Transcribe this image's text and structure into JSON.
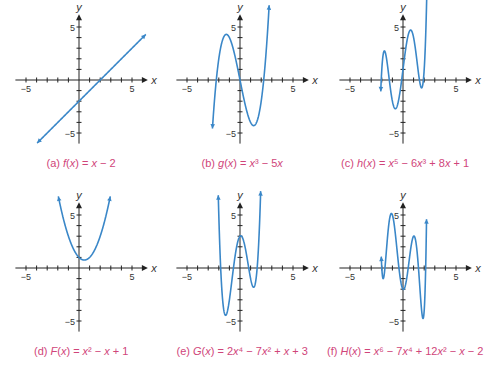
{
  "figure": {
    "background": "#ffffff",
    "curve_color": "#3a87c8",
    "axis_color": "#222222",
    "caption_color": "#d0457a",
    "unit_px": 10.6
  },
  "chart_data": [
    {
      "id": "a",
      "type": "line",
      "title": "(a) f(x) = x − 2",
      "caption_html": "(a) <i>f</i>(<i>x</i>) = <i>x</i> − 2",
      "expression": "x - 2",
      "xlabel": "x",
      "ylabel": "y",
      "x_ticks_labeled": [
        -5,
        5
      ],
      "y_ticks_labeled": [
        5,
        -5
      ],
      "xlim": [
        -6,
        6
      ],
      "ylim": [
        -6,
        6
      ],
      "domain": [
        -3.95,
        6.3
      ],
      "arrows": [
        "start",
        "end"
      ],
      "origin_px": [
        79,
        80
      ],
      "key_points": [
        [
          0,
          -2
        ],
        [
          2,
          0
        ],
        [
          -4,
          -6
        ],
        [
          6,
          4
        ]
      ]
    },
    {
      "id": "b",
      "type": "line",
      "title": "(b) g(x) = x³ − 5x",
      "caption_html": "(b) <i>g</i>(<i>x</i>) = <i>x</i>³ − 5<i>x</i>",
      "expression": "x^3 - 5x",
      "xlabel": "x",
      "ylabel": "y",
      "x_ticks_labeled": [
        -5,
        5
      ],
      "y_ticks_labeled": [
        5,
        -5
      ],
      "xlim": [
        -6,
        6
      ],
      "ylim": [
        -6,
        6
      ],
      "domain": [
        -2.6,
        2.75
      ],
      "arrows": [
        "start",
        "end"
      ],
      "origin_px": [
        240,
        80
      ],
      "key_points": [
        [
          -2.236,
          0
        ],
        [
          0,
          0
        ],
        [
          2.236,
          0
        ],
        [
          -1.29,
          4.3
        ],
        [
          1.29,
          -4.3
        ]
      ]
    },
    {
      "id": "c",
      "type": "line",
      "title": "(c) h(x) = x⁵ − 6x³ + 8x + 1",
      "caption_html": "(c) <i>h</i>(<i>x</i>) = <i>x</i>⁵ − 6<i>x</i>³ + 8<i>x</i> + 1",
      "expression": "x^5 - 6x^3 + 8x + 1",
      "xlabel": "x",
      "ylabel": "y",
      "x_ticks_labeled": [
        -5,
        5
      ],
      "y_ticks_labeled": [
        5,
        -5
      ],
      "xlim": [
        -6,
        6
      ],
      "ylim": [
        -6,
        6
      ],
      "domain": [
        -2.1,
        2.25
      ],
      "arrows": [
        "start",
        "end"
      ],
      "origin_px": [
        403,
        80
      ],
      "key_points": [
        [
          -1.6,
          3.3
        ],
        [
          -0.75,
          -4.0
        ],
        [
          0.75,
          5.0
        ],
        [
          1.6,
          -1.3
        ]
      ]
    },
    {
      "id": "d",
      "type": "line",
      "title": "(d) F(x) = x² − x + 1",
      "caption_html": "(d) <i>F</i>(<i>x</i>) = <i>x</i>² − <i>x</i> + 1",
      "expression": "x^2 - x + 1",
      "xlabel": "x",
      "ylabel": "y",
      "x_ticks_labeled": [
        -5,
        5
      ],
      "y_ticks_labeled": [
        5,
        -5
      ],
      "xlim": [
        -6,
        6
      ],
      "ylim": [
        -6,
        6
      ],
      "domain": [
        -1.95,
        2.95
      ],
      "arrows": [
        "start",
        "end"
      ],
      "origin_px": [
        79,
        268
      ],
      "key_points": [
        [
          0,
          1
        ],
        [
          0.5,
          0.75
        ],
        [
          1,
          1
        ]
      ]
    },
    {
      "id": "e",
      "type": "line",
      "title": "(e) G(x) = 2x⁴ − 7x² + x + 3",
      "caption_html": "(e) <i>G</i>(<i>x</i>) = 2<i>x</i>⁴ − 7<i>x</i>² + <i>x</i> + 3",
      "expression": "2x^4 - 7x^2 + x + 3",
      "xlabel": "x",
      "ylabel": "y",
      "x_ticks_labeled": [
        -5,
        5
      ],
      "y_ticks_labeled": [
        5,
        -5
      ],
      "xlim": [
        -6,
        6
      ],
      "ylim": [
        -6,
        6
      ],
      "domain": [
        -2.05,
        1.95
      ],
      "arrows": [
        "start",
        "end"
      ],
      "origin_px": [
        240,
        268
      ],
      "key_points": [
        [
          -1.4,
          -4.4
        ],
        [
          0.07,
          3.0
        ],
        [
          1.3,
          -1.8
        ]
      ]
    },
    {
      "id": "f",
      "type": "line",
      "title": "(f) H(x) = x⁶ − 7x⁴ + 12x² − x − 2",
      "caption_html": "(f) <i>H</i>(<i>x</i>) = <i>x</i>⁶ − 7<i>x</i>⁴ + 12<i>x</i>² − <i>x</i> − 2",
      "expression": "x^6 - 7x^4 + 12x^2 - x - 2",
      "xlabel": "x",
      "ylabel": "y",
      "x_ticks_labeled": [
        -5,
        5
      ],
      "y_ticks_labeled": [
        5,
        -5
      ],
      "xlim": [
        -6,
        6
      ],
      "ylim": [
        -6,
        6
      ],
      "domain": [
        -2.05,
        2.22
      ],
      "arrows": [
        "start",
        "end"
      ],
      "origin_px": [
        403,
        268
      ],
      "key_points": [
        [
          -1.95,
          -1.1
        ],
        [
          -1.05,
          5.1
        ],
        [
          0.04,
          -2.0
        ],
        [
          1.05,
          3.1
        ],
        [
          1.95,
          -4.9
        ]
      ]
    }
  ]
}
